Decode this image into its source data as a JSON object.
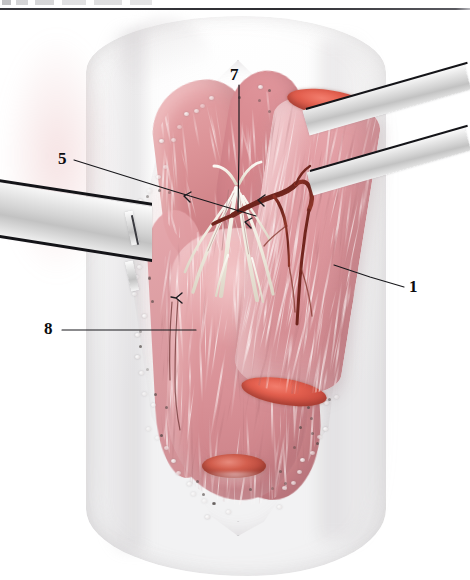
{
  "figure": {
    "domain": "anatomical-surgical-illustration",
    "caption_artifact_top": "",
    "background_color": "#ffffff",
    "rule_color": "#2e2e33",
    "palette": {
      "skin": "#fbfbfb",
      "muscle_light": "#e9adb1",
      "muscle_mid": "#d8929a",
      "muscle_dark": "#c87b82",
      "cut_muscle_red": "#e4604f",
      "vessel_dark_red": "#7d2a22",
      "nerve_white": "#f4f1ec",
      "steel_light": "#f2f2f2",
      "steel_dark": "#c2c2c2",
      "edge_black": "#141418",
      "leader_line": "#18181c",
      "label_text": "#0c0c0f"
    }
  },
  "labels": [
    {
      "id": "label-7",
      "text": "7",
      "x": 230,
      "y": 66
    },
    {
      "id": "label-5",
      "text": "5",
      "x": 58,
      "y": 150
    },
    {
      "id": "label-1",
      "text": "1",
      "x": 409,
      "y": 278
    },
    {
      "id": "label-8",
      "text": "8",
      "x": 44,
      "y": 320
    }
  ],
  "leaders": [
    {
      "id": "leader-7",
      "from_label": "7",
      "points": "239,85 239,150 238,212"
    },
    {
      "id": "leader-5",
      "from_label": "5",
      "points": "74,160 170,190 256,216"
    },
    {
      "id": "leader-1",
      "from_label": "1",
      "points": "404,287 370,277 334,265"
    },
    {
      "id": "leader-8",
      "from_label": "8",
      "points": "62,330 130,330 196,330"
    }
  ],
  "retractors": [
    {
      "id": "retractor-left",
      "side": "left",
      "blades": 1,
      "tip": "hooked"
    },
    {
      "id": "retractor-right",
      "side": "right",
      "blades": 2,
      "tip": "flat"
    }
  ],
  "structures": [
    {
      "id": "muscle-belly-reflected",
      "label_ref": "1"
    },
    {
      "id": "nerve-branches",
      "label_ref": "7"
    },
    {
      "id": "fascia-incision-edge",
      "label_ref": "5"
    },
    {
      "id": "deep-muscle-mass",
      "label_ref": "8"
    },
    {
      "id": "vascular-pedicle",
      "label_ref": null
    },
    {
      "id": "cut-tendon-stump",
      "label_ref": null
    }
  ]
}
